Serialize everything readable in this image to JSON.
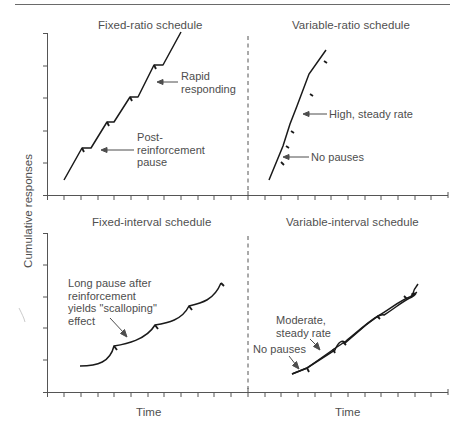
{
  "figure": {
    "y_axis_label": "Cumulative responses",
    "x_axis_label_left": "Time",
    "x_axis_label_right": "Time"
  },
  "panels": [
    {
      "id": "fixed-ratio",
      "title": "Fixed-ratio schedule",
      "annotations": [
        "Rapid\nresponding",
        "Post-\nreinforcement\npause"
      ]
    },
    {
      "id": "variable-ratio",
      "title": "Variable-ratio schedule",
      "annotations": [
        "High, steady rate",
        "No pauses"
      ]
    },
    {
      "id": "fixed-interval",
      "title": "Fixed-interval schedule",
      "annotations": [
        "Long pause after\nreinforcement\nyields \"scalloping\"\neffect"
      ]
    },
    {
      "id": "variable-interval",
      "title": "Variable-interval schedule",
      "annotations": [
        "Moderate,\nsteady rate",
        "No pauses"
      ]
    }
  ],
  "colors": {
    "line": "#1a1a1a",
    "axis": "#555555",
    "text": "#4d4d4d",
    "background": "#ffffff"
  }
}
